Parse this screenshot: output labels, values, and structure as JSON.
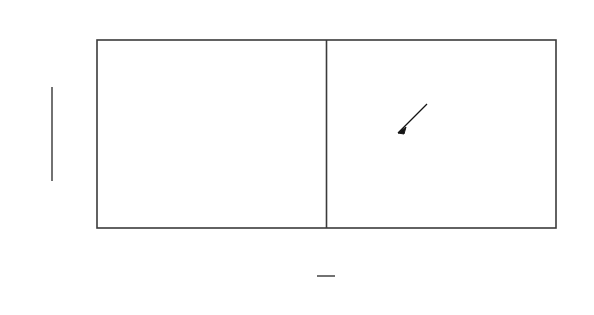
{
  "chart_data": {
    "type": "line",
    "title": "",
    "subtitle": "",
    "xlabel": "y/b",
    "ylabel": "(U_max - U)/(U_max - U_min)",
    "xlim": [
      -1.2,
      1.2
    ],
    "ylim": [
      0.0,
      1.05
    ],
    "grid": false,
    "legend_position": "none",
    "x_ticks": [
      -1.2,
      -1.0,
      -0.8,
      -0.6,
      -0.4,
      -0.2,
      0,
      0.2,
      0.4,
      0.6,
      0.8,
      1.0,
      1.2
    ],
    "x_tick_labels": [
      "−1.2",
      "",
      "−0.8",
      "",
      "−0.4",
      "",
      "0",
      "",
      "0.4",
      "",
      "0.8",
      "",
      "1.2"
    ],
    "y_ticks": [
      0.2,
      0.4,
      0.6,
      0.8,
      1.0
    ],
    "y_tick_labels": [
      "0.2",
      "0.4",
      "0.6",
      "0.8",
      "1.0"
    ],
    "series": [
      {
        "name": "mixing-length-theory-curve",
        "type": "line",
        "style": "solid",
        "color": "#111111",
        "x": [
          -1.2,
          -1.1,
          -1.0,
          -0.9,
          -0.8,
          -0.7,
          -0.6,
          -0.5,
          -0.4,
          -0.3,
          -0.2,
          -0.1,
          0.0,
          0.1,
          0.2,
          0.3,
          0.4,
          0.5,
          0.6,
          0.7,
          0.8,
          0.9,
          1.0,
          1.08
        ],
        "y": [
          0.01,
          0.018,
          0.028,
          0.045,
          0.075,
          0.135,
          0.215,
          0.32,
          0.445,
          0.59,
          0.74,
          0.89,
          0.985,
          0.96,
          0.88,
          0.76,
          0.62,
          0.48,
          0.345,
          0.23,
          0.135,
          0.07,
          0.028,
          0.012
        ]
      },
      {
        "name": "measured-data-points",
        "type": "scatter",
        "marker": "open-circle",
        "color": "#111111",
        "x": [
          -1.17,
          -1.09,
          -0.95,
          -0.88,
          -0.83,
          -0.79,
          -0.75,
          -0.7,
          -0.65,
          -0.6,
          -0.53,
          -0.47,
          -0.41,
          -0.35,
          -0.3,
          -0.25,
          -0.2,
          -0.16,
          -0.12,
          -0.07,
          -0.02,
          0.03,
          0.08,
          0.13,
          0.18,
          0.24,
          0.3,
          0.36,
          0.41,
          0.46,
          0.52,
          0.58,
          0.64,
          0.7,
          0.76,
          0.82,
          0.87,
          0.93,
          1.02
        ],
        "y": [
          0.012,
          0.014,
          0.035,
          0.052,
          0.06,
          0.085,
          0.105,
          0.13,
          0.17,
          0.215,
          0.285,
          0.355,
          0.43,
          0.51,
          0.57,
          0.625,
          0.7,
          0.76,
          0.8,
          0.86,
          0.93,
          0.975,
          0.965,
          0.95,
          0.93,
          0.88,
          0.81,
          0.72,
          0.665,
          0.61,
          0.53,
          0.45,
          0.37,
          0.29,
          0.205,
          0.135,
          0.09,
          0.05,
          0.018
        ]
      }
    ],
    "annotations": [
      {
        "name": "mixing-length-theory-label",
        "text": "混合長理論",
        "x": 0.52,
        "y": 0.78,
        "arrow_to_x": 0.3,
        "arrow_to_y": 0.5
      }
    ]
  },
  "axis_labels": {
    "y_numerator": "Uₘₐₓ−U",
    "y_denominator": "Uₘₐₓ−Uₘᵢₙ",
    "y_num_main": "U",
    "y_num_sub": "max",
    "y_num_minus_u": "−U",
    "y_den_main": "U",
    "y_den_sub": "max",
    "y_den_minus": "−U",
    "y_den_sub2": "min",
    "x_numerator": "y",
    "x_denominator": "b"
  },
  "colors": {
    "frame": "#3b3b3b",
    "curve": "#111111",
    "marker_fill": "#ffffff",
    "text": "#141414",
    "background": "#ffffff"
  }
}
